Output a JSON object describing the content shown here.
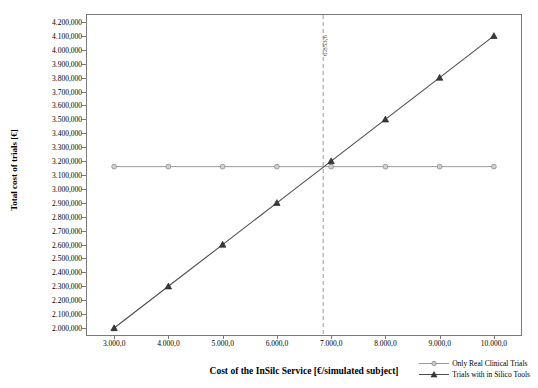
{
  "chart_data": {
    "type": "line",
    "title": "",
    "xlabel": "Cost of the InSilc Service [€/simulated subject]",
    "ylabel": "Total cost of trials [€]",
    "xlim": [
      2500,
      10500
    ],
    "ylim": [
      1950000,
      4250000
    ],
    "x_ticks": [
      "3.000,0",
      "4.000,0",
      "5.000,0",
      "6.000,0",
      "7.000,0",
      "8.000,0",
      "9.000,0",
      "10.000,0"
    ],
    "x_tick_values": [
      3000,
      4000,
      5000,
      6000,
      7000,
      8000,
      9000,
      10000
    ],
    "y_ticks": [
      "2.000,000",
      "2.100,000",
      "2.200,000",
      "2.300,000",
      "2.400,000",
      "2.500,000",
      "2.600,000",
      "2.700,000",
      "2.800,000",
      "2.900,000",
      "3.000,000",
      "3.100,000",
      "3.200,000",
      "3.300,000",
      "3.400,000",
      "3.500,000",
      "3.600,000",
      "3.700,000",
      "3.800,000",
      "3.900,000",
      "4.000,000",
      "4.100,000",
      "4.200,000"
    ],
    "y_tick_values": [
      2000000,
      2100000,
      2200000,
      2300000,
      2400000,
      2500000,
      2600000,
      2700000,
      2800000,
      2900000,
      3000000,
      3100000,
      3200000,
      3300000,
      3400000,
      3500000,
      3600000,
      3700000,
      3800000,
      3900000,
      4000000,
      4100000,
      4200000
    ],
    "grid": false,
    "legend_position": "bottom-right",
    "annotations": [
      {
        "name": "break-even-vline",
        "label": "6.853,6",
        "x": 6853.6,
        "style": "dashed",
        "color": "#9a9a9a"
      }
    ],
    "series": [
      {
        "name": "Only Real Clinical Trials",
        "color": "#9a9a9a",
        "marker": "circle",
        "x": [
          3000,
          4000,
          5000,
          6000,
          7000,
          8000,
          9000,
          10000
        ],
        "values": [
          3160000,
          3160000,
          3160000,
          3160000,
          3160000,
          3160000,
          3160000,
          3160000
        ]
      },
      {
        "name": "Trials with in Silico Tools",
        "color": "#4d4d4d",
        "marker": "triangle",
        "x": [
          3000,
          4000,
          5000,
          6000,
          7000,
          8000,
          9000,
          10000
        ],
        "values": [
          2000000,
          2300000,
          2600000,
          2900000,
          3200000,
          3500000,
          3800000,
          4100000
        ]
      }
    ]
  }
}
